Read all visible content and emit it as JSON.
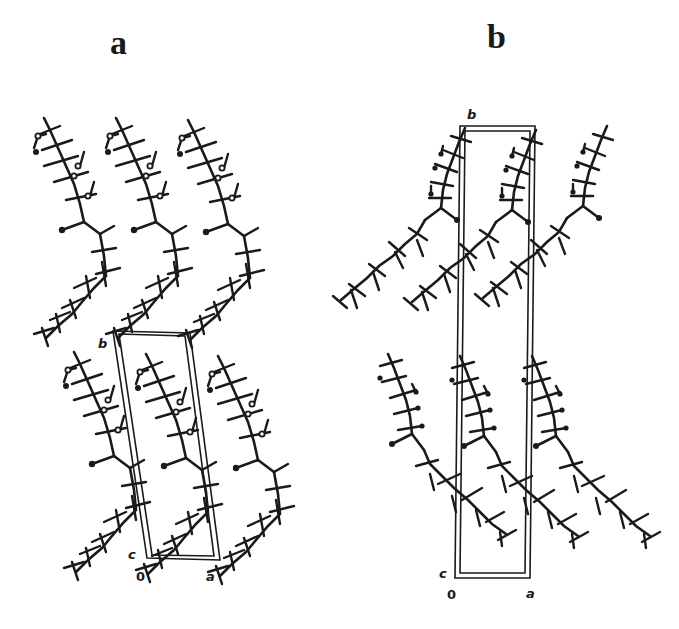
{
  "figure": {
    "panels": [
      {
        "id": "a",
        "label": "a",
        "unit_cell_axes": {
          "origin": "0",
          "a": "a",
          "b": "b",
          "c": "c"
        }
      },
      {
        "id": "b",
        "label": "b",
        "unit_cell_axes": {
          "origin": "0",
          "a": "a",
          "b": "b",
          "c": "c"
        }
      }
    ],
    "colors": {
      "ink": "#1a1a1a",
      "background": "#ffffff"
    }
  }
}
